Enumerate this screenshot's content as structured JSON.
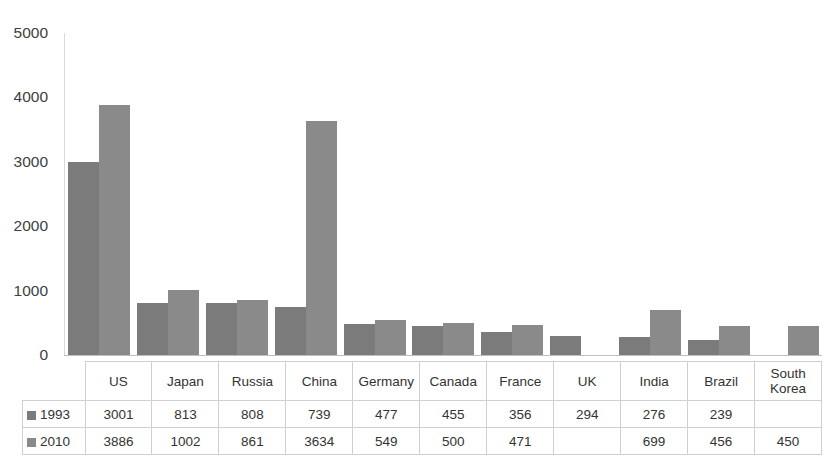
{
  "chart_data": {
    "type": "bar",
    "title": "",
    "subtitle": "",
    "xlabel": "",
    "ylabel": "",
    "ylim": [
      0,
      5000
    ],
    "ytick_step": 1000,
    "yticks": [
      "5000",
      "4000",
      "3000",
      "2000",
      "1000",
      "0"
    ],
    "grid": false,
    "legend_position": "data-table-left",
    "categories": [
      "US",
      "Japan",
      "Russia",
      "China",
      "Germany",
      "Canada",
      "France",
      "UK",
      "India",
      "Brazil",
      "South Korea"
    ],
    "series": [
      {
        "name": "1993",
        "color": "#7b7b7b",
        "values": [
          3001,
          813,
          808,
          739,
          477,
          455,
          356,
          294,
          276,
          239,
          null
        ],
        "labels": [
          "3001",
          "813",
          "808",
          "739",
          "477",
          "455",
          "356",
          "294",
          "276",
          "239",
          ""
        ]
      },
      {
        "name": "2010",
        "color": "#8a8a8a",
        "values": [
          3886,
          1002,
          861,
          3634,
          549,
          500,
          471,
          null,
          699,
          456,
          450
        ],
        "labels": [
          "3886",
          "1002",
          "861",
          "3634",
          "549",
          "500",
          "471",
          "",
          "699",
          "456",
          "450"
        ]
      }
    ]
  },
  "table": {
    "corner_label": "",
    "column_headers": [
      "US",
      "Japan",
      "Russia",
      "China",
      "Germany",
      "Canada",
      "France",
      "UK",
      "India",
      "Brazil",
      "South Korea"
    ],
    "rows": [
      {
        "series_label": "1993",
        "cells": [
          "3001",
          "813",
          "808",
          "739",
          "477",
          "455",
          "356",
          "294",
          "276",
          "239",
          ""
        ]
      },
      {
        "series_label": "2010",
        "cells": [
          "3886",
          "1002",
          "861",
          "3634",
          "549",
          "500",
          "471",
          "",
          "699",
          "456",
          "450"
        ]
      }
    ]
  },
  "colors": {
    "series_1993": "#7b7b7b",
    "series_2010": "#8a8a8a",
    "axis": "#bfbfbf",
    "table_border": "#d0d0d0",
    "text": "#333333",
    "background": "#ffffff"
  }
}
